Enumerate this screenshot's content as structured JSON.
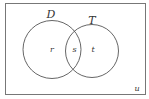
{
  "diagram": {
    "type": "venn",
    "universe_label": "u",
    "sets": [
      {
        "name": "D",
        "region_label": "r"
      },
      {
        "name": "T",
        "region_label": "t"
      }
    ],
    "intersection_label": "s"
  }
}
